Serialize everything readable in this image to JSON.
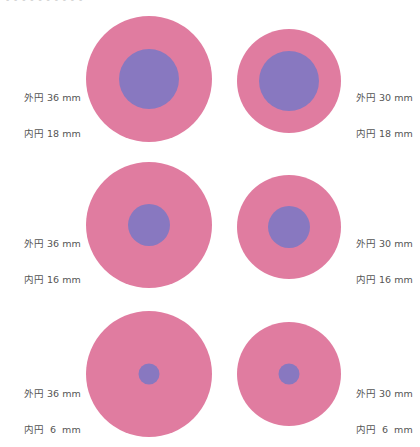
{
  "header": {
    "partial_text": "- - - - - - - - - -"
  },
  "colors": {
    "outer": "#E07CA0",
    "inner": "#8878C0"
  },
  "items": [
    {
      "outer_label": "外円 36 mm",
      "inner_label": "内円 18 mm",
      "outer_mm": 36,
      "inner_mm": 18
    },
    {
      "outer_label": "外円 30 mm",
      "inner_label": "内円 18 mm",
      "outer_mm": 30,
      "inner_mm": 18
    },
    {
      "outer_label": "外円 36 mm",
      "inner_label": "内円 16 mm",
      "outer_mm": 36,
      "inner_mm": 16
    },
    {
      "outer_label": "外円 30 mm",
      "inner_label": "内円 16 mm",
      "outer_mm": 30,
      "inner_mm": 16
    },
    {
      "outer_label": "外円 36 mm",
      "inner_label": "内円  6  mm",
      "outer_mm": 36,
      "inner_mm": 6
    },
    {
      "outer_label": "外円 30 mm",
      "inner_label": "内円  6  mm",
      "outer_mm": 30,
      "inner_mm": 6
    }
  ]
}
